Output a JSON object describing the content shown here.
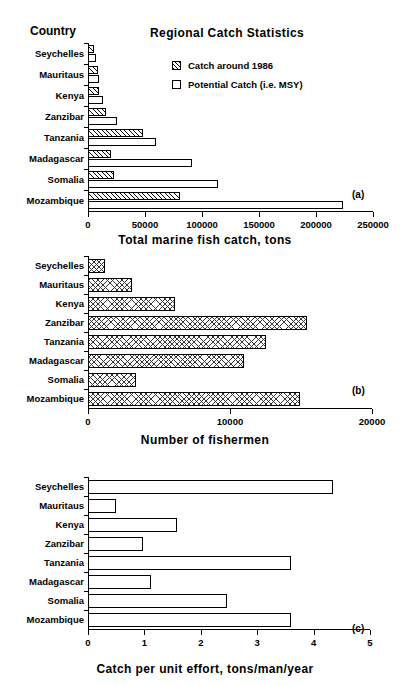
{
  "figure": {
    "countries": [
      "Seychelles",
      "Mauritaus",
      "Kenya",
      "Zanzibar",
      "Tanzania",
      "Madagascar",
      "Somalia",
      "Mozambique"
    ],
    "country_column_header": "Country",
    "panel_tags": {
      "a": "(a)",
      "b": "(b)",
      "c": "(c)"
    }
  },
  "panel_a": {
    "title": "Regional Catch Statistics",
    "axis_title": "Total marine fish catch, tons",
    "tag": "(a)",
    "legend": [
      {
        "label": "Catch around 1986",
        "style": "hatched"
      },
      {
        "label": "Potential Catch (i.e. MSY)",
        "style": "open"
      }
    ],
    "ticklabels": [
      "0",
      "50000",
      "100000",
      "150000",
      "200000",
      "250000"
    ]
  },
  "panel_b": {
    "axis_title": "Number of fishermen",
    "tag": "(b)",
    "ticklabels": [
      "0",
      "10000",
      "20000"
    ]
  },
  "panel_c": {
    "axis_title": "Catch per unit effort, tons/man/year",
    "tag": "(c)",
    "ticklabels": [
      "0",
      "1",
      "2",
      "3",
      "4",
      "5"
    ]
  },
  "chart_data": [
    {
      "type": "bar",
      "orientation": "horizontal",
      "id": "a",
      "title": "Regional Catch Statistics",
      "xlabel": "Total marine fish catch, tons",
      "ylabel": "Country",
      "xlim": [
        0,
        250000
      ],
      "xticks": [
        0,
        50000,
        100000,
        150000,
        200000,
        250000
      ],
      "grid": false,
      "legend_position": "top-center",
      "annotations": [
        "(a)"
      ],
      "categories": [
        "Seychelles",
        "Mauritaus",
        "Kenya",
        "Zanzibar",
        "Tanzania",
        "Madagascar",
        "Somalia",
        "Mozambique"
      ],
      "series": [
        {
          "name": "Catch around 1986",
          "fill": "hatched",
          "values": [
            5000,
            9000,
            10000,
            16000,
            48000,
            20000,
            23000,
            81000
          ]
        },
        {
          "name": "Potential Catch (i.e. MSY)",
          "fill": "open",
          "values": [
            7000,
            10000,
            13000,
            25000,
            60000,
            91000,
            114000,
            224000
          ]
        }
      ]
    },
    {
      "type": "bar",
      "orientation": "horizontal",
      "id": "b",
      "title": "",
      "xlabel": "Number of fishermen",
      "ylabel": "Country",
      "xlim": [
        0,
        20000
      ],
      "xticks": [
        0,
        10000,
        20000
      ],
      "grid": false,
      "legend_position": "none",
      "annotations": [
        "(b)"
      ],
      "categories": [
        "Seychelles",
        "Mauritaus",
        "Kenya",
        "Zanzibar",
        "Tanzania",
        "Madagascar",
        "Somalia",
        "Mozambique"
      ],
      "series": [
        {
          "name": "Number of fishermen",
          "fill": "crosshatched",
          "values": [
            1200,
            3100,
            6100,
            15400,
            12500,
            11000,
            3400,
            14900
          ]
        }
      ]
    },
    {
      "type": "bar",
      "orientation": "horizontal",
      "id": "c",
      "title": "",
      "xlabel": "Catch per unit effort, tons/man/year",
      "ylabel": "Country",
      "xlim": [
        0,
        5
      ],
      "xticks": [
        0,
        1,
        2,
        3,
        4,
        5
      ],
      "grid": false,
      "legend_position": "none",
      "annotations": [
        "(c)"
      ],
      "categories": [
        "Seychelles",
        "Mauritaus",
        "Kenya",
        "Zanzibar",
        "Tanzania",
        "Madagascar",
        "Somalia",
        "Mozambique"
      ],
      "series": [
        {
          "name": "Catch per unit effort",
          "fill": "open",
          "values": [
            4.35,
            0.5,
            1.57,
            0.98,
            3.6,
            1.12,
            2.47,
            3.6
          ]
        }
      ]
    }
  ]
}
